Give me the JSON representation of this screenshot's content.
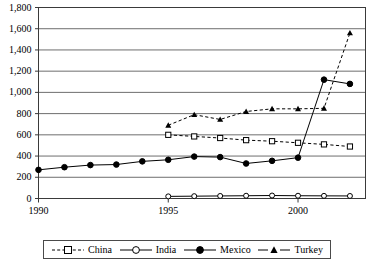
{
  "chart_data": {
    "type": "line",
    "title": "",
    "xlabel": "",
    "ylabel": "",
    "xlim": [
      1990,
      2002.6
    ],
    "ylim": [
      0,
      1800
    ],
    "grid": true,
    "grid_axis": "y",
    "legend_position": "bottom",
    "ytick_labels": [
      "0",
      "200",
      "400",
      "600",
      "800",
      "1,000",
      "1,200",
      "1,400",
      "1,600",
      "1,800"
    ],
    "ytick_values": [
      0,
      200,
      400,
      600,
      800,
      1000,
      1200,
      1400,
      1600,
      1800
    ],
    "xtick_labels": [
      "1990",
      "1995",
      "2000"
    ],
    "xtick_values": [
      1990,
      1995,
      2000
    ],
    "series": [
      {
        "name": "China",
        "line_style": "dashed",
        "marker": "open-square",
        "color": "#000000",
        "x": [
          1995,
          1996,
          1997,
          1998,
          1999,
          2000,
          2001,
          2002
        ],
        "values": [
          600,
          585,
          570,
          550,
          540,
          525,
          510,
          490
        ]
      },
      {
        "name": "India",
        "line_style": "solid",
        "marker": "open-circle",
        "color": "#000000",
        "x": [
          1995,
          1996,
          1997,
          1998,
          1999,
          2000,
          2001,
          2002
        ],
        "values": [
          20,
          22,
          24,
          26,
          28,
          26,
          25,
          24
        ]
      },
      {
        "name": "Mexico",
        "line_style": "solid",
        "marker": "filled-circle",
        "color": "#000000",
        "x": [
          1990,
          1991,
          1992,
          1993,
          1994,
          1995,
          1996,
          1997,
          1998,
          1999,
          2000,
          2001,
          2002
        ],
        "values": [
          270,
          295,
          315,
          320,
          350,
          365,
          395,
          390,
          330,
          355,
          385,
          1120,
          1080
        ]
      },
      {
        "name": "Turkey",
        "line_style": "dashed",
        "marker": "filled-triangle",
        "color": "#000000",
        "x": [
          1995,
          1996,
          1997,
          1998,
          1999,
          2000,
          2001,
          2002
        ],
        "values": [
          690,
          790,
          745,
          820,
          845,
          845,
          850,
          1560
        ]
      }
    ]
  },
  "legend": {
    "entries": [
      {
        "label": "China"
      },
      {
        "label": "India"
      },
      {
        "label": "Mexico"
      },
      {
        "label": "Turkey"
      }
    ]
  }
}
